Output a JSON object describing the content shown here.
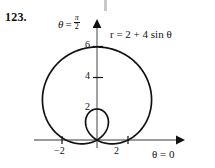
{
  "problem": {
    "number": "123."
  },
  "figure": {
    "vertical_axis_label": {
      "symbol": "θ",
      "equals": "=",
      "numerator": "π",
      "denominator": "2"
    },
    "horizontal_axis_label": "θ = 0",
    "equation": "r = 2 + 4 sin θ",
    "y_ticks": [
      "6",
      "4",
      "2"
    ],
    "x_ticks": [
      "−2",
      "2"
    ],
    "curve_color": "#111111",
    "axis_color": "#7a7a7a",
    "background_color": "#ffffff"
  },
  "chart_data": {
    "type": "line",
    "plot_kind": "polar",
    "title": "",
    "equation": "r = 2 + 4 sin θ",
    "curve_name": "limacon with inner loop",
    "a": 2,
    "b": 4,
    "theta_range_deg": [
      0,
      360
    ],
    "r_formula": "2 + 4*sin(theta)",
    "xlabel": "θ = 0",
    "ylabel": "θ = π/2",
    "x_ticks": [
      -2,
      2
    ],
    "y_ticks": [
      2,
      4,
      6
    ],
    "xlim": [
      -4.6,
      5.2
    ],
    "ylim": [
      -1.2,
      7.0
    ],
    "grid": false,
    "legend": "none",
    "key_points": [
      {
        "theta_deg": 0,
        "r": 2,
        "x": 2,
        "y": 0
      },
      {
        "theta_deg": 90,
        "r": 6,
        "x": 0,
        "y": 6
      },
      {
        "theta_deg": 180,
        "r": 2,
        "x": -2,
        "y": 0
      },
      {
        "theta_deg": 210,
        "r": 0,
        "x": 0,
        "y": 0
      },
      {
        "theta_deg": 270,
        "r": -2,
        "x": 0,
        "y": 2
      },
      {
        "theta_deg": 330,
        "r": 0,
        "x": 0,
        "y": 0
      }
    ],
    "inner_loop_max_y": 2,
    "outer_max_y": 6,
    "outer_x_extent": [
      -3.7,
      3.7
    ]
  }
}
